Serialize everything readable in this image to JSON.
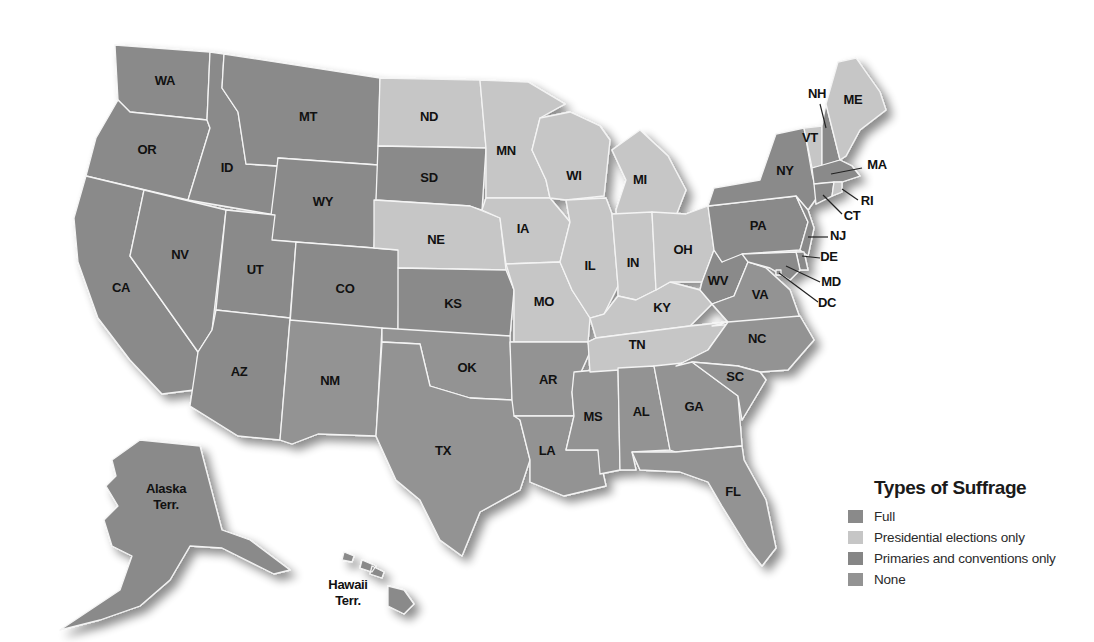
{
  "legend": {
    "title": "Types of Suffrage",
    "items": [
      {
        "key": "full",
        "label": "Full",
        "color": "#8a8a8a"
      },
      {
        "key": "presidential",
        "label": "Presidential elections only",
        "color": "#c6c6c6"
      },
      {
        "key": "primaries",
        "label": "Primaries and conventions only",
        "color": "#868686"
      },
      {
        "key": "none",
        "label": "None",
        "color": "#939393"
      }
    ]
  },
  "states": [
    {
      "abbr": "WA",
      "category": "full",
      "label_x": 165,
      "label_y": 82
    },
    {
      "abbr": "OR",
      "category": "full",
      "label_x": 147,
      "label_y": 151
    },
    {
      "abbr": "CA",
      "category": "full",
      "label_x": 121,
      "label_y": 289
    },
    {
      "abbr": "ID",
      "category": "full",
      "label_x": 227,
      "label_y": 169
    },
    {
      "abbr": "NV",
      "category": "full",
      "label_x": 180,
      "label_y": 256
    },
    {
      "abbr": "MT",
      "category": "full",
      "label_x": 308,
      "label_y": 118
    },
    {
      "abbr": "WY",
      "category": "full",
      "label_x": 323,
      "label_y": 203
    },
    {
      "abbr": "UT",
      "category": "full",
      "label_x": 255,
      "label_y": 271
    },
    {
      "abbr": "CO",
      "category": "full",
      "label_x": 345,
      "label_y": 290
    },
    {
      "abbr": "AZ",
      "category": "full",
      "label_x": 239,
      "label_y": 373
    },
    {
      "abbr": "NM",
      "category": "none",
      "label_x": 330,
      "label_y": 382
    },
    {
      "abbr": "ND",
      "category": "presidential",
      "label_x": 429,
      "label_y": 118
    },
    {
      "abbr": "SD",
      "category": "full",
      "label_x": 429,
      "label_y": 179
    },
    {
      "abbr": "NE",
      "category": "presidential",
      "label_x": 436,
      "label_y": 241
    },
    {
      "abbr": "KS",
      "category": "full",
      "label_x": 453,
      "label_y": 305
    },
    {
      "abbr": "OK",
      "category": "none",
      "label_x": 467,
      "label_y": 369
    },
    {
      "abbr": "TX",
      "category": "none",
      "label_x": 443,
      "label_y": 452
    },
    {
      "abbr": "MN",
      "category": "presidential",
      "label_x": 506,
      "label_y": 152
    },
    {
      "abbr": "IA",
      "category": "presidential",
      "label_x": 523,
      "label_y": 230
    },
    {
      "abbr": "MO",
      "category": "presidential",
      "label_x": 544,
      "label_y": 303
    },
    {
      "abbr": "AR",
      "category": "none",
      "label_x": 548,
      "label_y": 381
    },
    {
      "abbr": "LA",
      "category": "none",
      "label_x": 547,
      "label_y": 452
    },
    {
      "abbr": "WI",
      "category": "presidential",
      "label_x": 574,
      "label_y": 177
    },
    {
      "abbr": "IL",
      "category": "presidential",
      "label_x": 590,
      "label_y": 267
    },
    {
      "abbr": "MS",
      "category": "none",
      "label_x": 593,
      "label_y": 418
    },
    {
      "abbr": "MI",
      "category": "presidential",
      "label_x": 640,
      "label_y": 181
    },
    {
      "abbr": "IN",
      "category": "presidential",
      "label_x": 633,
      "label_y": 264
    },
    {
      "abbr": "KY",
      "category": "presidential",
      "label_x": 662,
      "label_y": 309
    },
    {
      "abbr": "TN",
      "category": "presidential",
      "label_x": 637,
      "label_y": 346
    },
    {
      "abbr": "AL",
      "category": "none",
      "label_x": 641,
      "label_y": 413
    },
    {
      "abbr": "OH",
      "category": "presidential",
      "label_x": 683,
      "label_y": 251
    },
    {
      "abbr": "GA",
      "category": "none",
      "label_x": 694,
      "label_y": 408
    },
    {
      "abbr": "FL",
      "category": "none",
      "label_x": 733,
      "label_y": 493
    },
    {
      "abbr": "WV",
      "category": "full",
      "label_x": 718,
      "label_y": 282
    },
    {
      "abbr": "VA",
      "category": "none",
      "label_x": 760,
      "label_y": 296
    },
    {
      "abbr": "NC",
      "category": "none",
      "label_x": 757,
      "label_y": 340
    },
    {
      "abbr": "SC",
      "category": "none",
      "label_x": 735,
      "label_y": 378
    },
    {
      "abbr": "PA",
      "category": "full",
      "label_x": 758,
      "label_y": 227
    },
    {
      "abbr": "NY",
      "category": "full",
      "label_x": 785,
      "label_y": 172
    },
    {
      "abbr": "VT",
      "category": "presidential",
      "label_x": 810,
      "label_y": 139
    },
    {
      "abbr": "NH",
      "category": "full",
      "label_x": 817,
      "label_y": 95
    },
    {
      "abbr": "ME",
      "category": "presidential",
      "label_x": 853,
      "label_y": 101
    },
    {
      "abbr": "MA",
      "category": "full",
      "label_x": 877,
      "label_y": 166
    },
    {
      "abbr": "RI",
      "category": "presidential",
      "label_x": 867,
      "label_y": 202
    },
    {
      "abbr": "CT",
      "category": "full",
      "label_x": 852,
      "label_y": 217
    },
    {
      "abbr": "NJ",
      "category": "full",
      "label_x": 838,
      "label_y": 237
    },
    {
      "abbr": "DE",
      "category": "full",
      "label_x": 829,
      "label_y": 258
    },
    {
      "abbr": "MD",
      "category": "full",
      "label_x": 831,
      "label_y": 283
    },
    {
      "abbr": "DC",
      "category": "full",
      "label_x": 827,
      "label_y": 304
    }
  ],
  "territories": [
    {
      "name": "Alaska",
      "suffix": "Terr.",
      "category": "full",
      "label_x": 166,
      "label_y": 497
    },
    {
      "name": "Hawaii",
      "suffix": "Terr.",
      "category": "full",
      "label_x": 348,
      "label_y": 593
    }
  ]
}
